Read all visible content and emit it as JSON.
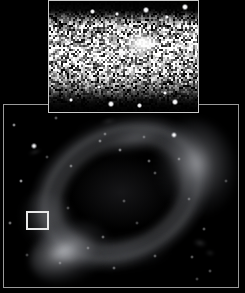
{
  "figure": {
    "title": "Ring galaxy wide-field image with magnified inset",
    "background_color": "#000000",
    "width": 245,
    "height": 293
  },
  "main_panel": {
    "name": "wide-field image",
    "border_color": "#9a9a9a",
    "background_color": "#000000",
    "x": 3,
    "y": 104,
    "width": 236,
    "height": 184,
    "object": {
      "type": "ring galaxy",
      "description": "inclined elliptical ring with two bright knots",
      "ring_position_angle_deg": -27,
      "bright_knots": [
        "south-west",
        "east"
      ]
    },
    "selection_box": {
      "label": "inset field of view",
      "color": "#e9e9e9",
      "x": 25,
      "y": 210,
      "width": 23,
      "height": 19
    }
  },
  "inset_panel": {
    "name": "magnified cutout",
    "border_color": "#c9c9c9",
    "background_color": "#000000",
    "x": 48,
    "y": 0,
    "width": 151,
    "height": 113,
    "description": "high-contrast stretched zoom of the boxed region showing a dense resolved stellar field with a bright central source"
  },
  "stars": {
    "main": [
      {
        "x": 10,
        "y": 20,
        "r": 1.2,
        "b": 0.55
      },
      {
        "x": 30,
        "y": 41,
        "r": 1.6,
        "b": 0.95
      },
      {
        "x": 17,
        "y": 76,
        "r": 1.0,
        "b": 0.6
      },
      {
        "x": 6,
        "y": 118,
        "r": 0.9,
        "b": 0.45
      },
      {
        "x": 52,
        "y": 13,
        "r": 0.8,
        "b": 0.35
      },
      {
        "x": 67,
        "y": 61,
        "r": 0.9,
        "b": 0.4
      },
      {
        "x": 96,
        "y": 36,
        "r": 0.9,
        "b": 0.42
      },
      {
        "x": 101,
        "y": 29,
        "r": 0.8,
        "b": 0.35
      },
      {
        "x": 116,
        "y": 45,
        "r": 1.0,
        "b": 0.48
      },
      {
        "x": 145,
        "y": 56,
        "r": 0.9,
        "b": 0.4
      },
      {
        "x": 140,
        "y": 32,
        "r": 0.8,
        "b": 0.3
      },
      {
        "x": 151,
        "y": 68,
        "r": 0.8,
        "b": 0.32
      },
      {
        "x": 120,
        "y": 96,
        "r": 0.8,
        "b": 0.3
      },
      {
        "x": 185,
        "y": 94,
        "r": 0.8,
        "b": 0.3
      },
      {
        "x": 175,
        "y": 54,
        "r": 0.9,
        "b": 0.36
      },
      {
        "x": 99,
        "y": 132,
        "r": 0.9,
        "b": 0.38
      },
      {
        "x": 84,
        "y": 143,
        "r": 0.8,
        "b": 0.3
      },
      {
        "x": 151,
        "y": 151,
        "r": 0.9,
        "b": 0.34
      },
      {
        "x": 188,
        "y": 152,
        "r": 0.9,
        "b": 0.34
      },
      {
        "x": 110,
        "y": 163,
        "r": 0.9,
        "b": 0.36
      },
      {
        "x": 56,
        "y": 158,
        "r": 0.8,
        "b": 0.28
      },
      {
        "x": 200,
        "y": 124,
        "r": 0.9,
        "b": 0.34
      },
      {
        "x": 170,
        "y": 30,
        "r": 2.2,
        "b": 1.0
      },
      {
        "x": 64,
        "y": 103,
        "r": 0.8,
        "b": 0.28
      },
      {
        "x": 133,
        "y": 118,
        "r": 0.8,
        "b": 0.26
      },
      {
        "x": 206,
        "y": 166,
        "r": 0.9,
        "b": 0.3
      },
      {
        "x": 222,
        "y": 76,
        "r": 0.8,
        "b": 0.26
      },
      {
        "x": 43,
        "y": 52,
        "r": 0.8,
        "b": 0.28
      },
      {
        "x": 23,
        "y": 150,
        "r": 0.8,
        "b": 0.26
      },
      {
        "x": 193,
        "y": 174,
        "r": 0.8,
        "b": 0.26
      }
    ],
    "smudges": [
      {
        "x": 31,
        "y": 47,
        "w": 14,
        "h": 4,
        "o": 0.26,
        "rot": -18
      },
      {
        "x": 104,
        "y": 16,
        "w": 17,
        "h": 6,
        "o": 0.16,
        "rot": -12
      },
      {
        "x": 196,
        "y": 138,
        "w": 14,
        "h": 8,
        "o": 0.22,
        "rot": 12
      },
      {
        "x": 206,
        "y": 148,
        "w": 10,
        "h": 6,
        "o": 0.18,
        "rot": 8
      }
    ]
  },
  "inset_sources": {
    "bright": [
      {
        "x": 97,
        "y": 9,
        "r": 2.1
      },
      {
        "x": 136,
        "y": 6,
        "r": 1.8
      },
      {
        "x": 43,
        "y": 10,
        "r": 1.4
      },
      {
        "x": 118,
        "y": 16,
        "r": 1.2
      },
      {
        "x": 68,
        "y": 13,
        "r": 1.1
      },
      {
        "x": 20,
        "y": 42,
        "r": 1.2
      },
      {
        "x": 57,
        "y": 38,
        "r": 1.1
      },
      {
        "x": 33,
        "y": 62,
        "r": 1.3
      },
      {
        "x": 108,
        "y": 58,
        "r": 1.1
      },
      {
        "x": 128,
        "y": 44,
        "r": 1.1
      },
      {
        "x": 88,
        "y": 74,
        "r": 1.1
      },
      {
        "x": 50,
        "y": 86,
        "r": 1.2
      },
      {
        "x": 116,
        "y": 92,
        "r": 1.3
      },
      {
        "x": 22,
        "y": 99,
        "r": 1.3
      },
      {
        "x": 62,
        "y": 103,
        "r": 1.9
      },
      {
        "x": 90,
        "y": 104,
        "r": 1.4
      },
      {
        "x": 126,
        "y": 101,
        "r": 2.0
      },
      {
        "x": 10,
        "y": 70,
        "r": 1.0
      },
      {
        "x": 142,
        "y": 70,
        "r": 1.0
      },
      {
        "x": 76,
        "y": 24,
        "r": 1.2
      }
    ]
  }
}
